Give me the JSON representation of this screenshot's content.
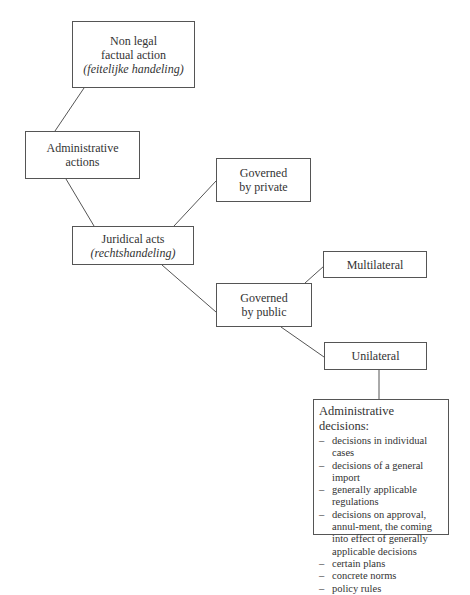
{
  "diagram": {
    "nodes": {
      "non_legal": {
        "line1": "Non legal",
        "line2": "factual action",
        "line3": "(feitelijke handeling)"
      },
      "admin_actions": {
        "line1": "Administrative",
        "line2": "actions"
      },
      "gov_private": {
        "line1": "Governed",
        "line2": "by private"
      },
      "juridical": {
        "line1": "Juridical acts",
        "line2": "(rechtshandeling)"
      },
      "multilateral": {
        "line1": "Multilateral"
      },
      "gov_public": {
        "line1": "Governed",
        "line2": "by public"
      },
      "unilateral": {
        "line1": "Unilateral"
      },
      "admin_decisions": {
        "title": "Administrative decisions:",
        "items": [
          "decisions in individual cases",
          "decisions of a general import",
          "generally applicable regulations",
          "decisions on approval, annul-ment, the coming into effect of generally applicable decisions",
          "certain plans",
          "concrete norms",
          "policy rules"
        ]
      }
    },
    "edges": [
      [
        "non_legal",
        "admin_actions"
      ],
      [
        "admin_actions",
        "juridical"
      ],
      [
        "juridical",
        "gov_private"
      ],
      [
        "juridical",
        "gov_public"
      ],
      [
        "gov_public",
        "multilateral"
      ],
      [
        "gov_public",
        "unilateral"
      ],
      [
        "unilateral",
        "admin_decisions"
      ]
    ],
    "colors": {
      "border": "#555555",
      "line": "#555555",
      "text": "#333333"
    }
  }
}
